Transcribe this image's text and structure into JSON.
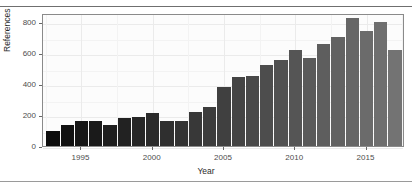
{
  "figure": {
    "title": "",
    "width": 412,
    "height": 189,
    "panel_background": "#fcfcfc",
    "grid_color": "#ebebeb",
    "axis_text_color": "#4d4d4d",
    "bar_color_start": "#0d0d0d",
    "bar_color_end": "#737373"
  },
  "axes": {
    "y_title": "References",
    "x_title": "Year",
    "y_ticks": [
      0,
      200,
      400,
      600,
      800
    ],
    "y_tick_labels": [
      "0",
      "200",
      "400",
      "600",
      "800"
    ],
    "x_ticks": [
      1995,
      2000,
      2005,
      2010,
      2015
    ],
    "x_tick_labels": [
      "1995",
      "2000",
      "2005",
      "2010",
      "2015"
    ]
  },
  "chart_data": {
    "type": "bar",
    "title": "",
    "xlabel": "Year",
    "ylabel": "References",
    "xlim": [
      1992.3,
      2017.7
    ],
    "ylim": [
      0,
      860
    ],
    "grid": true,
    "legend": "none",
    "categories": [
      "1993",
      "1994",
      "1995",
      "1996",
      "1997",
      "1998",
      "1999",
      "2000",
      "2001",
      "2002",
      "2003",
      "2004",
      "2005",
      "2006",
      "2007",
      "2008",
      "2009",
      "2010",
      "2011",
      "2012",
      "2013",
      "2014",
      "2015",
      "2016",
      "2017"
    ],
    "values": [
      98,
      135,
      160,
      163,
      138,
      180,
      188,
      215,
      160,
      160,
      220,
      253,
      383,
      448,
      455,
      525,
      553,
      623,
      570,
      660,
      705,
      825,
      742,
      802,
      755
    ],
    "values_note": "25 bars, 1993 through 2017",
    "extra_values": {
      "2017": 620
    }
  }
}
